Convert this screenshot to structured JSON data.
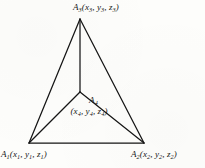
{
  "figure": {
    "kind": "geometry-diagram",
    "colors": {
      "background": "#fdfdfb",
      "ink": "#151515"
    },
    "vertices": {
      "a3": {
        "name": "A",
        "name_sub": "3",
        "open_paren": "(",
        "x_sym": "x",
        "x_sub": "3",
        "comma1": ", ",
        "y_sym": "y",
        "y_sub": "3",
        "comma2": ", ",
        "z_sym": "z",
        "z_sub": "3",
        "close_paren": ")"
      },
      "a1": {
        "name": "A",
        "name_sub": "1",
        "open_paren": "(",
        "x_sym": "x",
        "x_sub": "1",
        "comma1": ", ",
        "y_sym": "y",
        "y_sub": "1",
        "comma2": ", ",
        "z_sym": "z",
        "z_sub": "1",
        "close_paren": ")"
      },
      "a2": {
        "name": "A",
        "name_sub": "2",
        "open_paren": "(",
        "x_sym": "x",
        "x_sub": "2",
        "comma1": ", ",
        "y_sym": "y",
        "y_sub": "2",
        "comma2": ", ",
        "z_sym": "z",
        "z_sub": "2",
        "close_paren": ")"
      },
      "a4": {
        "name": "A",
        "name_sub": "4",
        "open_paren": "(",
        "x_sym": "x",
        "x_sub": "4",
        "comma1": ", ",
        "y_sym": "y",
        "y_sub": "4",
        "comma2": ", ",
        "z_sym": "z",
        "z_sub": "4",
        "close_paren": ")"
      }
    }
  }
}
